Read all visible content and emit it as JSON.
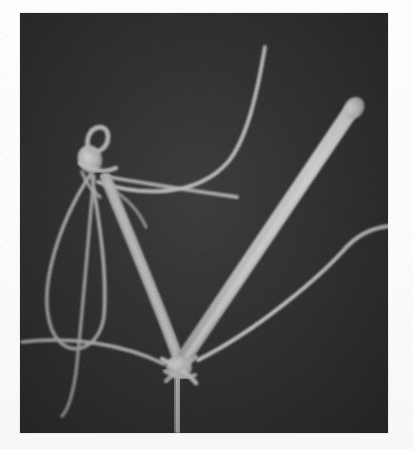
{
  "figure": {
    "kind": "electron-micrograph",
    "caption": "",
    "alt_description": "Dark-field electron micrograph showing branched filamentous structures with two knot-like junctions",
    "panel": {
      "x": 20,
      "y": 13,
      "width": 368,
      "height": 420,
      "background_color": "#2f2f2f",
      "border_color": "#c8c8c8"
    },
    "page_background_color": "#fdfdfd"
  },
  "palette": {
    "background_dark": "#2f2f2f",
    "background_darker": "#262626",
    "filament_bright": "#c6c6c6",
    "filament_mid": "#9e9e9e",
    "filament_dim": "#7d7d7d",
    "rod_body": "#a8a8a8",
    "rod_highlight": "#cfcfcf",
    "knot_core": "#b4b4b4",
    "stem_body": "#b0b0b0"
  },
  "structures": [
    {
      "id": "thick-rod",
      "label": "thick tapered rod with knobbed tip",
      "stroke": "#a8a8a8",
      "width_start": 17,
      "width_end": 8,
      "path": "M 180 360 L 348 115"
    },
    {
      "id": "rod-knob",
      "label": "bulbous tip of thick rod",
      "fill": "#c4c4c4",
      "cx": 352,
      "cy": 108,
      "rx": 11,
      "ry": 9
    },
    {
      "id": "thick-stem",
      "label": "vertical thick stem descending to panel edge",
      "stroke": "#b0b0b0",
      "width": 16,
      "path": "M 176 365 L 178 433"
    },
    {
      "id": "upper-left-strut",
      "label": "thick strut from lower junction to upper knot",
      "stroke": "#a5a5a5",
      "width": 11,
      "path": "M 178 362 C 160 310, 130 240, 104 176"
    },
    {
      "id": "upper-knot",
      "label": "upper knot junction with small loop",
      "fill": "#b4b4b4",
      "cx": 88,
      "cy": 158,
      "rx": 12,
      "ry": 14
    },
    {
      "id": "knot-loop",
      "label": "small open loop above upper knot",
      "stroke": "#ababab",
      "width": 5,
      "path": "M 86 146 C 82 126, 104 120, 104 136 C 104 147, 94 152, 88 150"
    },
    {
      "id": "long-upper-curve",
      "label": "long thin filament curving to upper right",
      "stroke": "#b8b8b8",
      "width": 4,
      "path": "M 98 182 C 140 196, 196 198, 228 162 C 248 138, 258 88, 265 47"
    },
    {
      "id": "short-branch",
      "label": "short filament branch terminating mid-field",
      "stroke": "#a9a9a9",
      "width": 4,
      "path": "M 102 176 C 138 182, 186 190, 237 197"
    },
    {
      "id": "left-teardrop-loop",
      "label": "large teardrop loop on left side",
      "stroke": "#a6a6a6",
      "width": 4,
      "path": "M 92 172 C 60 220, 36 290, 52 330 C 66 362, 100 350, 104 316 C 108 266, 96 206, 92 176"
    },
    {
      "id": "left-descending-strand",
      "label": "thin strand descending from knot past the loop",
      "stroke": "#9c9c9c",
      "width": 4,
      "path": "M 94 176 C 88 240, 82 320, 76 372 C 72 400, 66 412, 62 416"
    },
    {
      "id": "lower-left-sweep",
      "label": "thin filament sweeping from left edge to lower junction",
      "stroke": "#b0b0b0",
      "width": 4,
      "path": "M 22 342 C 70 336, 124 344, 164 364"
    },
    {
      "id": "right-long-filament",
      "label": "thin filament entering from right edge and running to lower junction",
      "stroke": "#bcbcbc",
      "width": 4,
      "path": "M 388 226 C 366 228, 352 238, 340 252 C 316 278, 256 330, 196 360"
    },
    {
      "id": "lower-junction",
      "label": "lower knot junction where strands cross",
      "fill": "#bcbcbc",
      "cx": 178,
      "cy": 366,
      "rx": 13,
      "ry": 11
    }
  ],
  "annotations": {
    "scale_bar_present": false,
    "labels_present": false,
    "text_present": false
  }
}
